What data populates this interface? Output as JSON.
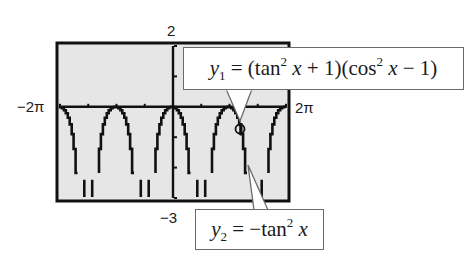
{
  "chart_data": {
    "type": "line",
    "title": "",
    "xlabel": "",
    "ylabel": "",
    "xlim": [
      -6.283,
      6.283
    ],
    "ylim": [
      -3,
      2
    ],
    "x_tick_labels": {
      "min": "−2π",
      "max": "2π"
    },
    "y_tick_labels": {
      "max": "2",
      "min": "−3"
    },
    "x_tick_step": "π/2",
    "y_tick_step": 1,
    "grid": false,
    "background": "#e6e6e6",
    "series": [
      {
        "name": "y1",
        "expression": "(tan^2 x + 1)(cos^2 x - 1)",
        "color": "#111111"
      },
      {
        "name": "y2",
        "expression": "-tan^2 x",
        "color": "#111111"
      }
    ],
    "sample_points": {
      "x": [
        -6.283,
        -5.498,
        -4.712,
        -3.927,
        -3.142,
        -2.356,
        -1.571,
        -0.785,
        0,
        0.785,
        1.571,
        2.356,
        3.142,
        3.927,
        4.712,
        5.498,
        6.283
      ],
      "y": [
        0,
        -1,
        null,
        -1,
        0,
        -1,
        null,
        -1,
        0,
        -1,
        null,
        -1,
        0,
        -1,
        null,
        -1,
        0
      ]
    },
    "annotations": [
      {
        "text": "y1 = (tan² x + 1)(cos² x − 1)",
        "points_to": "curve near x ≈ 3.4"
      },
      {
        "text": "y2 = −tan² x",
        "points_to": "curve near x ≈ 3.6"
      }
    ],
    "marker": {
      "shape": "circle-cursor",
      "x": 3.6,
      "y": -0.25
    }
  },
  "labels": {
    "ymax": "2",
    "ymin": "−3",
    "xmin": "−2π",
    "xmax": "2π"
  },
  "callouts": {
    "y1": {
      "var": "y",
      "sub": "1",
      "eq_pre": " = (tan",
      "sup1": "2",
      "mid": " x",
      "mid2": " + 1)(cos",
      "sup2": "2",
      "post_x": " x",
      "post": " − 1)"
    },
    "y2": {
      "var": "y",
      "sub": "2",
      "eq_pre": " = −tan",
      "sup": "2",
      "post_x": " x"
    }
  }
}
